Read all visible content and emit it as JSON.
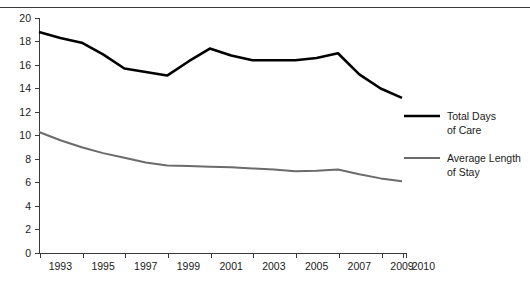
{
  "chart_data": {
    "type": "line",
    "title": "",
    "subtitle": "",
    "xlabel": "",
    "ylabel": "",
    "grid": false,
    "legend_position": "right",
    "ylim": [
      0,
      20
    ],
    "ytick_values": [
      0,
      2,
      4,
      6,
      8,
      10,
      12,
      14,
      16,
      18,
      20
    ],
    "ytick_labels": [
      "0",
      "2",
      "4",
      "6",
      "8",
      "10",
      "12",
      "14",
      "16",
      "18",
      "20"
    ],
    "x": [
      1993,
      1994,
      1995,
      1996,
      1997,
      1998,
      1999,
      2000,
      2001,
      2002,
      2003,
      2004,
      2005,
      2006,
      2007,
      2008,
      2009,
      2010
    ],
    "xtick_labels": [
      "1993",
      "1995",
      "1997",
      "1999",
      "2001",
      "2003",
      "2005",
      "2007",
      "2009",
      "2010"
    ],
    "xtick_label_years": [
      1993,
      1995,
      1997,
      1999,
      2001,
      2003,
      2005,
      2007,
      2009,
      2010
    ],
    "series": [
      {
        "name": "Total Days of Care",
        "color": "#000000",
        "width": 2.6,
        "values": [
          18.8,
          18.3,
          17.9,
          16.9,
          15.7,
          15.4,
          15.1,
          16.3,
          17.4,
          16.8,
          16.4,
          16.4,
          16.4,
          16.6,
          17.0,
          15.2,
          14.0,
          13.2
        ]
      },
      {
        "name": "Average Length of Stay",
        "color": "#6b6b6b",
        "width": 2.0,
        "values": [
          10.3,
          9.6,
          9.0,
          8.5,
          8.1,
          7.7,
          7.45,
          7.4,
          7.35,
          7.3,
          7.2,
          7.1,
          6.95,
          7.0,
          7.1,
          6.7,
          6.35,
          6.1
        ]
      }
    ]
  },
  "legend": {
    "entries": [
      {
        "line1": "Total Days",
        "line2": "of Care",
        "color": "#000000"
      },
      {
        "line1": "Average Length",
        "line2": "of Stay",
        "color": "#6b6b6b"
      }
    ]
  }
}
